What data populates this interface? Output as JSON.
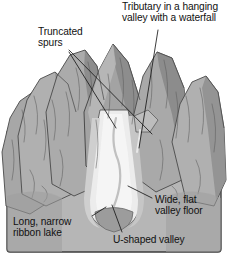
{
  "figure": {
    "background_color": "#ffffff",
    "panel_color": "#b6b6b6",
    "panel_border_color": "#3d3d3d",
    "leader_line_color": "#1a1a1a",
    "label_text_color": "#111111"
  },
  "labels": {
    "truncated_spurs": "Truncated\nspurs",
    "hanging_valley": "Tributary in a hanging\nvalley with a waterfall",
    "valley_floor": "Wide, flat\nvalley floor",
    "ribbon_lake": "Long, narrow\nribbon lake",
    "ushaped_valley": "U-shaped valley"
  }
}
